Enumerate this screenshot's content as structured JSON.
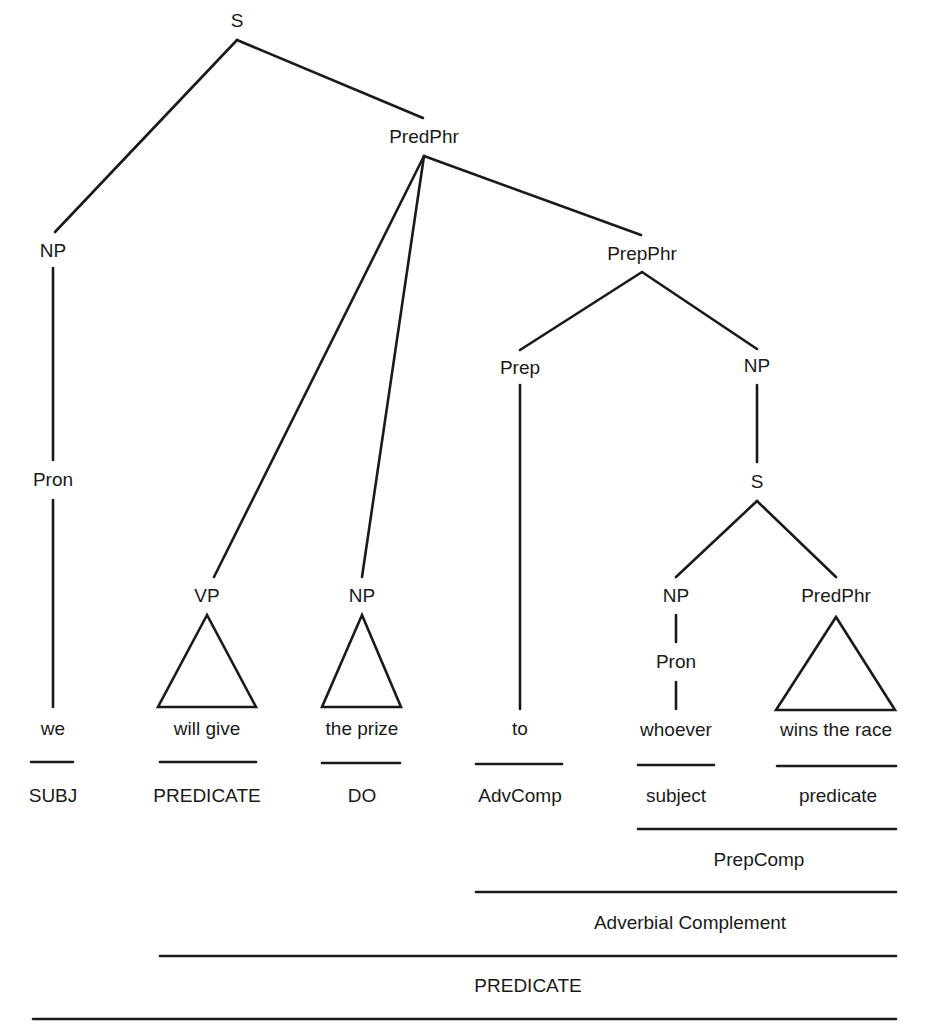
{
  "diagram": {
    "type": "syntax-tree",
    "sentence": "we will give the prize to whoever wins the race",
    "nodes": [
      {
        "id": "s_root",
        "label": "S",
        "x": 237,
        "y": 22
      },
      {
        "id": "predphr_main",
        "label": "PredPhr",
        "x": 424,
        "y": 138
      },
      {
        "id": "np_subj",
        "label": "NP",
        "x": 53,
        "y": 252
      },
      {
        "id": "pron_subj",
        "label": "Pron",
        "x": 53,
        "y": 481
      },
      {
        "id": "prepphr",
        "label": "PrepPhr",
        "x": 642,
        "y": 255
      },
      {
        "id": "prep",
        "label": "Prep",
        "x": 520,
        "y": 369
      },
      {
        "id": "np_obj",
        "label": "NP",
        "x": 757,
        "y": 367
      },
      {
        "id": "s_embedded",
        "label": "S",
        "x": 757,
        "y": 483
      },
      {
        "id": "vp",
        "label": "VP",
        "x": 207,
        "y": 597
      },
      {
        "id": "np_do",
        "label": "NP",
        "x": 362,
        "y": 597
      },
      {
        "id": "np_sub2",
        "label": "NP",
        "x": 676,
        "y": 597
      },
      {
        "id": "predphr_sub",
        "label": "PredPhr",
        "x": 836,
        "y": 597
      },
      {
        "id": "pron_sub2",
        "label": "Pron",
        "x": 676,
        "y": 663
      }
    ],
    "edges": [
      [
        237,
        40,
        55,
        232
      ],
      [
        237,
        40,
        423,
        118
      ],
      [
        424,
        156,
        214,
        577
      ],
      [
        424,
        156,
        362,
        577
      ],
      [
        424,
        156,
        641,
        235
      ],
      [
        642,
        272,
        520,
        350
      ],
      [
        642,
        272,
        757,
        349
      ],
      [
        53,
        268,
        53,
        460
      ],
      [
        53,
        500,
        53,
        707
      ],
      [
        520,
        385,
        520,
        709
      ],
      [
        757,
        385,
        757,
        462
      ],
      [
        757,
        501,
        676,
        577
      ],
      [
        757,
        501,
        836,
        577
      ],
      [
        676,
        615,
        676,
        642
      ],
      [
        676,
        682,
        676,
        709
      ]
    ],
    "triangles": [
      {
        "apex": [
          207,
          615
        ],
        "left": 158,
        "right": 256,
        "base_y": 707
      },
      {
        "apex": [
          362,
          615
        ],
        "left": 322,
        "right": 401,
        "base_y": 707
      },
      {
        "apex": [
          836,
          617
        ],
        "left": 776,
        "right": 895,
        "base_y": 710
      }
    ],
    "leaves": [
      {
        "id": "leaf_we",
        "label": "we",
        "x": 53,
        "y": 730
      },
      {
        "id": "leaf_will_give",
        "label": "will give",
        "x": 207,
        "y": 730
      },
      {
        "id": "leaf_the_prize",
        "label": "the prize",
        "x": 362,
        "y": 730
      },
      {
        "id": "leaf_to",
        "label": "to",
        "x": 520,
        "y": 730
      },
      {
        "id": "leaf_whoever",
        "label": "whoever",
        "x": 676,
        "y": 731
      },
      {
        "id": "leaf_wins_the_race",
        "label": "wins the race",
        "x": 836,
        "y": 731
      }
    ],
    "function_bars": [
      {
        "id": "subj",
        "label": "SUBJ",
        "x1": 31,
        "x2": 73,
        "bar_y": 762,
        "label_x": 53,
        "label_y": 797
      },
      {
        "id": "predicate_short",
        "label": "PREDICATE",
        "x1": 160,
        "x2": 256,
        "bar_y": 762,
        "label_x": 207,
        "label_y": 797
      },
      {
        "id": "do",
        "label": "DO",
        "x1": 322,
        "x2": 400,
        "bar_y": 763,
        "label_x": 362,
        "label_y": 797
      },
      {
        "id": "advcomp",
        "label": "AdvComp",
        "x1": 476,
        "x2": 562,
        "bar_y": 764,
        "label_x": 520,
        "label_y": 797
      },
      {
        "id": "subject_lower",
        "label": "subject",
        "x1": 638,
        "x2": 714,
        "bar_y": 765,
        "label_x": 676,
        "label_y": 797
      },
      {
        "id": "predicate_lower",
        "label": "predicate",
        "x1": 777,
        "x2": 896,
        "bar_y": 766,
        "label_x": 838,
        "label_y": 797
      },
      {
        "id": "prepcomp",
        "label": "PrepComp",
        "x1": 638,
        "x2": 896,
        "bar_y": 829,
        "label_x": 759,
        "label_y": 861
      },
      {
        "id": "adverbial_complement",
        "label": "Adverbial Complement",
        "x1": 476,
        "x2": 896,
        "bar_y": 892,
        "label_x": 690,
        "label_y": 924
      },
      {
        "id": "predicate_long",
        "label": "PREDICATE",
        "x1": 160,
        "x2": 896,
        "bar_y": 956,
        "label_x": 528,
        "label_y": 987
      },
      {
        "id": "sentence_line",
        "label": "",
        "x1": 33,
        "x2": 896,
        "bar_y": 1019,
        "label_x": 0,
        "label_y": 0
      }
    ]
  }
}
